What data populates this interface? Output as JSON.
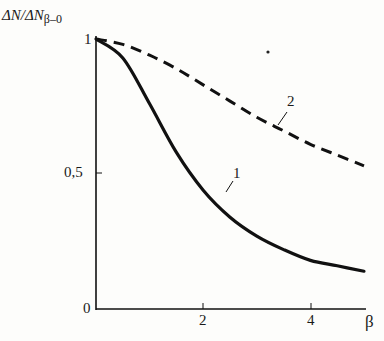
{
  "chart_data": {
    "type": "line",
    "title": "",
    "xlabel": "β",
    "ylabel": "ΔN/ΔN_β=0",
    "ylabel_main": "ΔN/ΔN",
    "ylabel_sub": "β=0",
    "xlim": [
      0,
      5
    ],
    "ylim": [
      0,
      1
    ],
    "x_ticks": [
      "0",
      "2",
      "4"
    ],
    "y_ticks": [
      "0",
      "0,5",
      "1"
    ],
    "grid": false,
    "legend": "curve labels inline (1, 2)",
    "x": [
      0,
      0.5,
      1,
      1.5,
      2,
      2.5,
      3,
      3.5,
      4,
      4.5,
      5
    ],
    "series": [
      {
        "name": "1",
        "style": "solid",
        "values": [
          1.0,
          0.93,
          0.76,
          0.58,
          0.44,
          0.34,
          0.27,
          0.22,
          0.18,
          0.16,
          0.14
        ]
      },
      {
        "name": "2",
        "style": "dashed",
        "values": [
          1.0,
          0.98,
          0.94,
          0.89,
          0.83,
          0.77,
          0.71,
          0.66,
          0.61,
          0.57,
          0.53
        ]
      }
    ],
    "annotations": [
      "1",
      "2"
    ]
  },
  "labels": {
    "y_axis_main": "ΔN/ΔN",
    "y_axis_sub": "β–0",
    "x_axis": "β",
    "tick_0": "0",
    "tick_05": "0,5",
    "tick_1": "1",
    "tick_x2": "2",
    "tick_x4": "4",
    "curve1": "1",
    "curve2": "2"
  }
}
